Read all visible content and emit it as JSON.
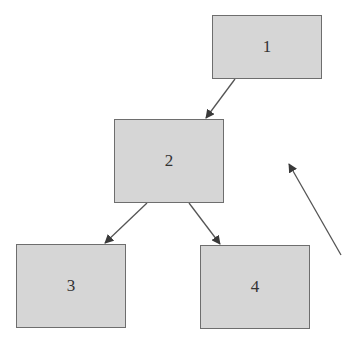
{
  "diagram": {
    "nodes": [
      {
        "id": "1",
        "label": "1",
        "x": 212,
        "y": 15,
        "w": 110,
        "h": 64
      },
      {
        "id": "2",
        "label": "2",
        "x": 114,
        "y": 119,
        "w": 110,
        "h": 84
      },
      {
        "id": "3",
        "label": "3",
        "x": 16,
        "y": 244,
        "w": 110,
        "h": 84
      },
      {
        "id": "4",
        "label": "4",
        "x": 200,
        "y": 245,
        "w": 110,
        "h": 84
      }
    ],
    "edges": [
      {
        "from": "1",
        "to": "2"
      },
      {
        "from": "2",
        "to": "3"
      },
      {
        "from": "2",
        "to": "4"
      }
    ],
    "free_arrows": [
      {
        "from_point": [
          341,
          255
        ],
        "to_point": [
          288,
          163
        ]
      }
    ],
    "colors": {
      "node_fill": "#d6d6d6",
      "node_border": "#6e6e6e",
      "arrow": "#555555"
    }
  }
}
